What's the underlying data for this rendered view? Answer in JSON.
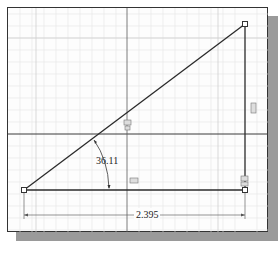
{
  "sketch": {
    "title": "Triangle sketch",
    "dimensions": {
      "horizontal_length": "2.395",
      "angle": "36.11"
    },
    "points": [
      {
        "name": "bottom-left",
        "x": 24,
        "y": 190
      },
      {
        "name": "bottom-right",
        "x": 245,
        "y": 190
      },
      {
        "name": "top-right",
        "x": 245,
        "y": 24
      }
    ],
    "constraints": [
      {
        "name": "hypotenuse-constraint",
        "x": 127,
        "y": 124
      },
      {
        "name": "horizontal-constraint",
        "x": 133,
        "y": 181
      },
      {
        "name": "vertical-constraint",
        "x": 254,
        "y": 108
      },
      {
        "name": "corner-constraint",
        "x": 244,
        "y": 180
      }
    ],
    "colors": {
      "line": "#2a2a2a",
      "grid": "#e4e4e4",
      "axis": "#555555",
      "shadow": "#9a9a9a"
    }
  }
}
